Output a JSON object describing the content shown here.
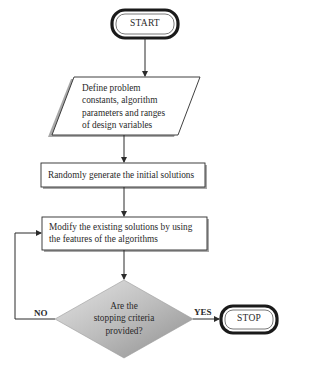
{
  "flowchart": {
    "start": {
      "label": "START"
    },
    "define": {
      "lines": [
        "Define problem",
        "constants, algorithm",
        "parameters and ranges",
        "of design variables"
      ]
    },
    "generate": {
      "label": "Randomly generate the initial solutions"
    },
    "modify": {
      "lines": [
        "Modify the existing solutions by using",
        "the features of the algorithms"
      ]
    },
    "decision": {
      "lines": [
        "Are the",
        "stopping criteria",
        "provided?"
      ]
    },
    "edges": {
      "no_label": "NO",
      "yes_label": "YES"
    },
    "stop": {
      "label": "STOP"
    }
  },
  "colors": {
    "stroke": "#2b2b2b",
    "decision_fill_light": "#d9d9d9",
    "decision_fill_dark": "#9a9a9a",
    "shadow": "#9e9e9e"
  }
}
